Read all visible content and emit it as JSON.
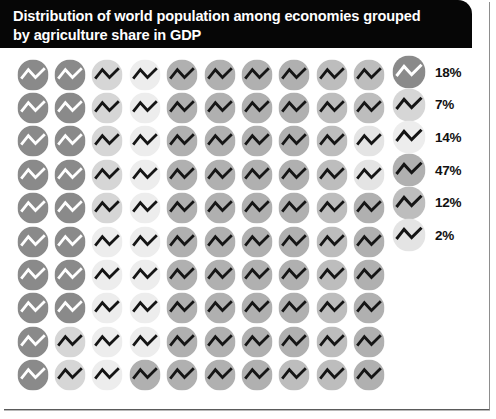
{
  "title": "Distribution of world population among economies grouped\nby agriculture share in GDP",
  "chart_data": {
    "type": "pie",
    "title": "Distribution of world population among economies grouped by agriculture share in GDP",
    "subtitle": "",
    "xlabel": "",
    "ylabel": "",
    "units": "percent of world population",
    "render": "waffle-dot-matrix",
    "grid": {
      "rows": 10,
      "columns": 10,
      "fill_order": "column-major-top-to-bottom",
      "total_cells": 100
    },
    "legend": {
      "position": "right",
      "entries_count": 6
    },
    "categories": [
      "18%",
      "7%",
      "14%",
      "47%",
      "12%",
      "2%"
    ],
    "values": [
      18,
      7,
      14,
      47,
      12,
      2
    ],
    "series": [
      {
        "name": "population share",
        "values": [
          18,
          7,
          14,
          47,
          12,
          2
        ]
      }
    ],
    "slices": [
      {
        "label": "18%",
        "value": 18,
        "color": "#8a8a8a",
        "glyph_color": "#ffffff",
        "cells": 18
      },
      {
        "label": "7%",
        "value": 7,
        "color": "#d6d6d6",
        "glyph_color": "#151515",
        "cells": 7
      },
      {
        "label": "14%",
        "value": 14,
        "color": "#ededed",
        "glyph_color": "#151515",
        "cells": 14
      },
      {
        "label": "47%",
        "value": 47,
        "color": "#b0b0b0",
        "glyph_color": "#151515",
        "cells": 47
      },
      {
        "label": "12%",
        "value": 12,
        "color": "#bdbdbd",
        "glyph_color": "#151515",
        "cells": 12
      },
      {
        "label": "2%",
        "value": 2,
        "color": "#e4e4e4",
        "glyph_color": "#151515",
        "cells": 2
      }
    ],
    "cell_icon": "zigzag-line-icon",
    "cell_shape": "circle",
    "cell_category_index": [
      0,
      0,
      0,
      0,
      0,
      0,
      0,
      0,
      0,
      0,
      0,
      0,
      0,
      0,
      0,
      0,
      0,
      0,
      1,
      1,
      1,
      1,
      1,
      1,
      1,
      2,
      2,
      2,
      2,
      2,
      2,
      2,
      2,
      2,
      2,
      2,
      2,
      2,
      2,
      3,
      3,
      3,
      3,
      3,
      3,
      3,
      3,
      3,
      3,
      3,
      3,
      3,
      3,
      3,
      3,
      3,
      3,
      3,
      3,
      3,
      3,
      3,
      3,
      3,
      3,
      3,
      3,
      3,
      3,
      3,
      3,
      3,
      3,
      3,
      3,
      3,
      3,
      3,
      3,
      4,
      4,
      4,
      4,
      4,
      4,
      4,
      4,
      4,
      4,
      4,
      4,
      4,
      5,
      5,
      3,
      3,
      3,
      3,
      3,
      3
    ]
  },
  "legend_items": [
    {
      "label": "18%"
    },
    {
      "label": "7%"
    },
    {
      "label": "14%"
    },
    {
      "label": "47%"
    },
    {
      "label": "12%"
    },
    {
      "label": "2%"
    }
  ]
}
